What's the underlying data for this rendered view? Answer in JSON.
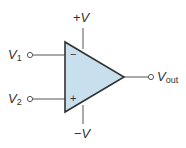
{
  "diagram": {
    "colors": {
      "triangle_fill": "#c8e0ee",
      "stroke": "#333333",
      "wire": "#555555",
      "text": "#333333"
    },
    "supply": {
      "positive": {
        "sign": "+",
        "symbol": "V"
      },
      "negative": {
        "sign": "−",
        "symbol": "V"
      }
    },
    "inputs": [
      {
        "symbol": "V",
        "subscript": "1",
        "pin_sign": "−",
        "pin": "inverting"
      },
      {
        "symbol": "V",
        "subscript": "2",
        "pin_sign": "+",
        "pin": "non-inverting"
      }
    ],
    "output": {
      "symbol": "V",
      "subscript": "out"
    }
  }
}
